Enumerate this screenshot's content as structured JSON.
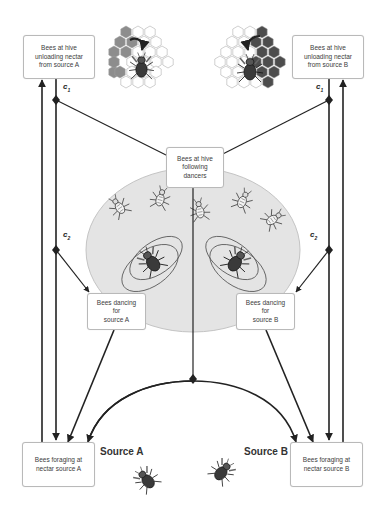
{
  "diagram": {
    "colors": {
      "line": "#222222",
      "box_border": "#b9b9b9",
      "ellipse_fill": "#e4e4e4",
      "ellipse_border": "#bdbdbd",
      "comb_dark": "#8a8a8a",
      "comb_light": "#ffffff"
    },
    "boxes": {
      "unload_a": [
        "Bees at hive",
        "unloading nectar",
        "from source A"
      ],
      "unload_b": [
        "Bees at hive",
        "unloading nectar",
        "from source B"
      ],
      "following": [
        "Bees at hive",
        "following",
        "dancers"
      ],
      "dance_a": [
        "Bees dancing for",
        "source A"
      ],
      "dance_b": [
        "Bees dancing for",
        "source B"
      ],
      "forage_a": [
        "Bees foraging at",
        "nectar source A"
      ],
      "forage_b": [
        "Bees foraging at",
        "nectar source B"
      ]
    },
    "labels": {
      "source_a": "Source A",
      "source_b": "Source B",
      "c": "c",
      "c1_sub": "1",
      "c2_sub": "2"
    },
    "icons": [
      "honeycomb-bee-icon-left",
      "honeycomb-bee-icon-right",
      "dance-floor-ellipse",
      "waggle-dance-bee-icon",
      "follower-bee-icon",
      "forager-bee-icon"
    ]
  }
}
